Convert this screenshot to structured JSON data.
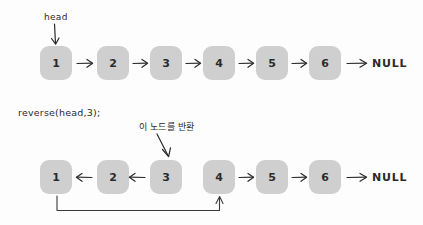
{
  "diagram": {
    "title_text": "",
    "background_color": "#fdfdfd",
    "node_fill_color": "#cfcfcf",
    "ink_color": "#2b2b2b"
  },
  "top_row": {
    "head_label": "head",
    "nodes": [
      {
        "value": "1"
      },
      {
        "value": "2"
      },
      {
        "value": "3"
      },
      {
        "value": "4"
      },
      {
        "value": "5"
      },
      {
        "value": "6"
      }
    ],
    "terminator": "NULL",
    "link_arrows": [
      "→",
      "→",
      "→",
      "→",
      "→",
      "→"
    ]
  },
  "call_label": "reverse(head,3);",
  "bottom_row": {
    "annotation_kr": "이 노드를 반환",
    "nodes": [
      {
        "value": "1"
      },
      {
        "value": "2"
      },
      {
        "value": "3"
      },
      {
        "value": "4"
      },
      {
        "value": "5"
      },
      {
        "value": "6"
      }
    ],
    "terminator": "NULL",
    "link_arrows": [
      "←",
      "←",
      "→",
      "→",
      "→"
    ],
    "return_pointer_note": ""
  }
}
